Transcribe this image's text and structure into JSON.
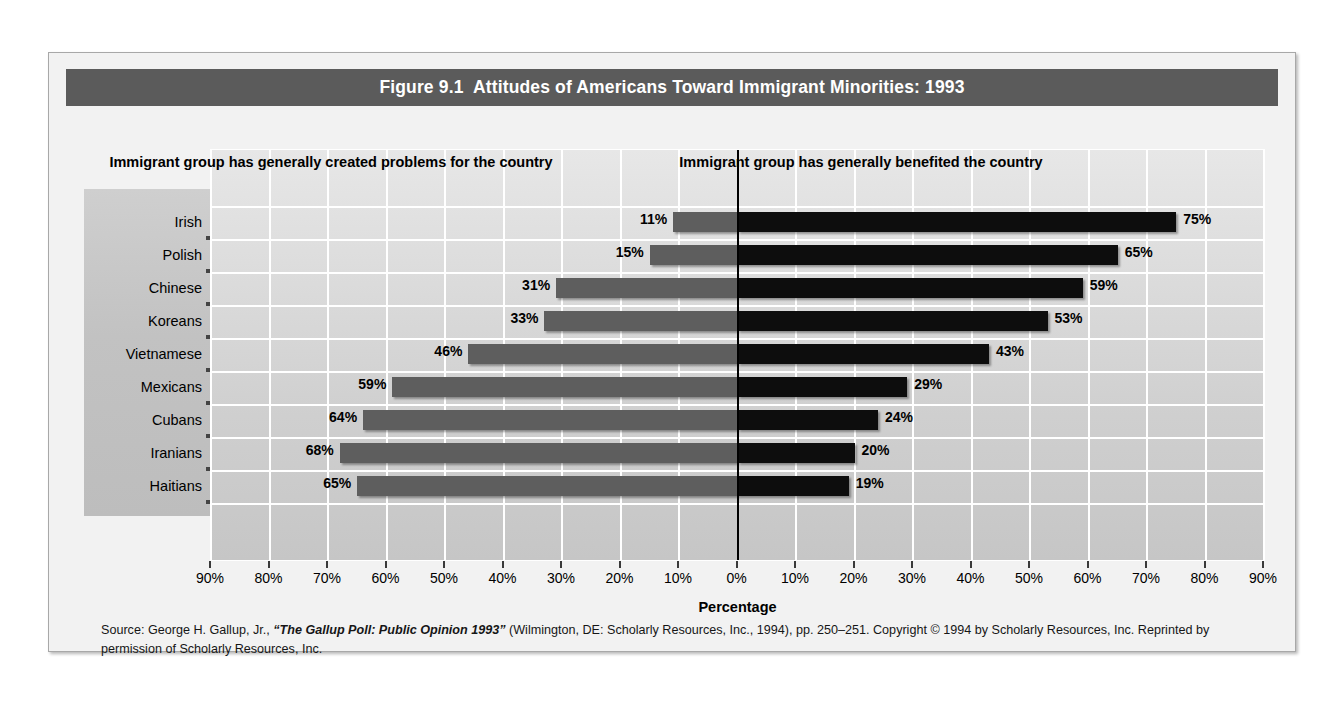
{
  "figure": {
    "title": "Figure 9.1  Attitudes of Americans Toward Immigrant Minorities: 1993",
    "source_note": "Source: George H. Gallup, Jr., \"The Gallup Poll: Public Opinion 1993\" (Wilmington, DE: Scholarly Resources, Inc., 1994), pp. 250–251. Copyright © 1994 by Scholarly Resources, Inc. Reprinted by permission of Scholarly Resources, Inc.",
    "source_prefix": "Source: George H. Gallup, Jr., ",
    "source_italic": "“The Gallup Poll: Public Opinion 1993”",
    "source_suffix": " (Wilmington, DE: Scholarly Resources, Inc., 1994), pp. 250–251. Copyright © 1994 by Scholarly Resources, Inc. Reprinted by permission of Scholarly Resources, Inc."
  },
  "headings": {
    "left": "Immigrant group has generally created problems for the country",
    "right": "Immigrant group has generally benefited the country"
  },
  "colors": {
    "title_bar": "#5b5b5b",
    "bar_left": "#5e5e5e",
    "bar_right": "#0d0d0d",
    "plot_background": "#d8d8d8",
    "gridline": "#ffffff",
    "zero_line": "#000000"
  },
  "chart_data": {
    "type": "bar",
    "orientation": "horizontal",
    "layout": "diverging",
    "title": "Figure 9.1  Attitudes of Americans Toward Immigrant Minorities: 1993",
    "xlabel": "Percentage",
    "ylabel": "",
    "xlim": [
      -90,
      90
    ],
    "xticks": [
      -90,
      -80,
      -70,
      -60,
      -50,
      -40,
      -30,
      -20,
      -10,
      0,
      10,
      20,
      30,
      40,
      50,
      60,
      70,
      80,
      90
    ],
    "xtick_labels": [
      "90%",
      "80%",
      "70%",
      "60%",
      "50%",
      "40%",
      "30%",
      "20%",
      "10%",
      "0%",
      "10%",
      "20%",
      "30%",
      "40%",
      "50%",
      "60%",
      "70%",
      "80%",
      "90%"
    ],
    "grid": true,
    "legend": false,
    "categories": [
      "Irish",
      "Polish",
      "Chinese",
      "Koreans",
      "Vietnamese",
      "Mexicans",
      "Cubans",
      "Iranians",
      "Haitians"
    ],
    "series": [
      {
        "name": "Immigrant group has generally created problems for the country",
        "direction": "left",
        "color": "#5e5e5e",
        "values": [
          11,
          15,
          31,
          33,
          46,
          59,
          64,
          68,
          65
        ],
        "labels": [
          "11%",
          "15%",
          "31%",
          "33%",
          "46%",
          "59%",
          "64%",
          "68%",
          "65%"
        ]
      },
      {
        "name": "Immigrant group has generally benefited the country",
        "direction": "right",
        "color": "#0d0d0d",
        "values": [
          75,
          65,
          59,
          53,
          43,
          29,
          24,
          20,
          19
        ],
        "labels": [
          "75%",
          "65%",
          "59%",
          "53%",
          "43%",
          "29%",
          "24%",
          "20%",
          "19%"
        ]
      }
    ]
  }
}
